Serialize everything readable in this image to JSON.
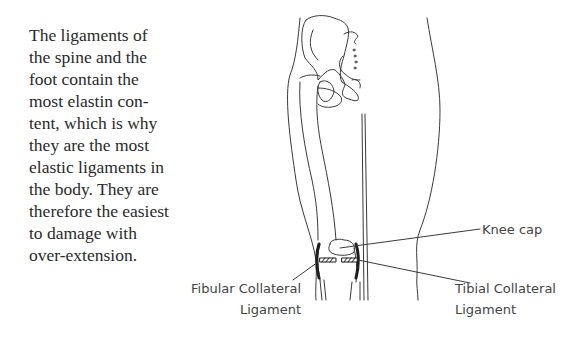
{
  "paragraph": {
    "lines": [
      "The ligaments of",
      "the spine and the",
      "foot contain the",
      "most elastin con-",
      "tent, which is why",
      "they are the most",
      "elastic ligaments in",
      "the body. They are",
      "therefore the easiest",
      "to damage with",
      "over-extension."
    ]
  },
  "figure": {
    "labels": {
      "knee_cap": "Knee cap",
      "fibular": [
        "Fibular Collateral",
        "Ligament"
      ],
      "tibial": [
        "Tibial Collateral",
        "Ligament"
      ]
    },
    "colors": {
      "line": "#3a3a3a",
      "ligament": "#1e1e1e"
    }
  }
}
